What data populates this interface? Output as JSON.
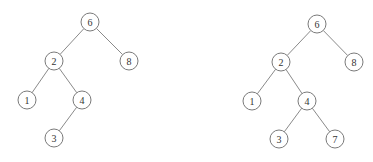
{
  "trees": [
    {
      "name": "tree-before-insert",
      "nodes": [
        {
          "id": "n6",
          "label": "6",
          "x": 90,
          "y": 22
        },
        {
          "id": "n2",
          "label": "2",
          "x": 54,
          "y": 61
        },
        {
          "id": "n8",
          "label": "8",
          "x": 129,
          "y": 61
        },
        {
          "id": "n1",
          "label": "1",
          "x": 27,
          "y": 100
        },
        {
          "id": "n4",
          "label": "4",
          "x": 82,
          "y": 100
        },
        {
          "id": "n3",
          "label": "3",
          "x": 54,
          "y": 138
        }
      ],
      "edges": [
        [
          "n6",
          "n2"
        ],
        [
          "n6",
          "n8"
        ],
        [
          "n2",
          "n1"
        ],
        [
          "n2",
          "n4"
        ],
        [
          "n4",
          "n3"
        ]
      ]
    },
    {
      "name": "tree-after-insert",
      "nodes": [
        {
          "id": "n6",
          "label": "6",
          "x": 317,
          "y": 24
        },
        {
          "id": "n2",
          "label": "2",
          "x": 281,
          "y": 62
        },
        {
          "id": "n8",
          "label": "8",
          "x": 354,
          "y": 62
        },
        {
          "id": "n1",
          "label": "1",
          "x": 252,
          "y": 101
        },
        {
          "id": "n4",
          "label": "4",
          "x": 307,
          "y": 101
        },
        {
          "id": "n3",
          "label": "3",
          "x": 279,
          "y": 139
        },
        {
          "id": "n7",
          "label": "7",
          "x": 335,
          "y": 139
        }
      ],
      "edges": [
        [
          "n6",
          "n2"
        ],
        [
          "n6",
          "n8"
        ],
        [
          "n2",
          "n1"
        ],
        [
          "n2",
          "n4"
        ],
        [
          "n4",
          "n3"
        ],
        [
          "n4",
          "n7"
        ]
      ]
    }
  ],
  "style": {
    "node_radius": 9,
    "stroke_color": "#7a7a7a",
    "text_color": "#333333"
  }
}
